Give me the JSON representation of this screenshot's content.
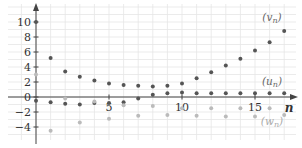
{
  "chart_data": {
    "type": "scatter",
    "title": "",
    "xlabel": "n",
    "ylabel": "",
    "xlim": [
      -0.5,
      19
    ],
    "ylim": [
      -6,
      12
    ],
    "grid": true,
    "legend": "inline-right",
    "x_ticks": [
      5,
      10,
      15
    ],
    "x_tick_labels": [
      "5",
      "10",
      "15"
    ],
    "y_ticks": [
      10,
      8,
      6,
      4,
      2,
      0,
      -2,
      -4
    ],
    "y_tick_labels": [
      "10",
      "8",
      "6",
      "4",
      "2",
      "0",
      "−2",
      "−4"
    ],
    "colors": {
      "dark": "#555555",
      "light": "#bbbbbb",
      "axis": "#444444",
      "grid": "#e6e6e6"
    },
    "series": [
      {
        "name": "(v_n)",
        "label_main": "(v",
        "label_sub": "n",
        "label_close": ")",
        "shade": "dark",
        "x": [
          0,
          1,
          2,
          3,
          4,
          5,
          6,
          7,
          8,
          9,
          10,
          11,
          12,
          13,
          14,
          15,
          16,
          17
        ],
        "values": [
          10,
          5.2,
          3.4,
          2.7,
          2.2,
          1.8,
          1.6,
          1.5,
          1.4,
          1.5,
          1.8,
          2.5,
          3.3,
          4.2,
          5.1,
          6.2,
          7.3,
          8.8
        ]
      },
      {
        "name": "(u_n)",
        "label_main": "(u",
        "label_sub": "n",
        "label_close": ")",
        "shade": "dark",
        "x": [
          0,
          1,
          2,
          3,
          4,
          5,
          6,
          7,
          8,
          9,
          10,
          11,
          12,
          13,
          14,
          15,
          16,
          17
        ],
        "values": [
          -0.5,
          -0.7,
          -0.9,
          -1,
          -0.8,
          -0.8,
          -0.7,
          -0.2,
          0.3,
          0.5,
          0.6,
          0.5,
          0.5,
          0.5,
          0.5,
          0.5,
          0.5,
          0.5
        ]
      },
      {
        "name": "(w_n)",
        "label_main": "(w",
        "label_sub": "n",
        "label_close": ")",
        "shade": "light",
        "x": [
          0,
          1,
          2,
          3,
          4,
          5,
          6,
          7,
          8,
          9,
          10,
          11,
          12,
          13,
          14,
          15,
          16,
          17
        ],
        "values": [
          3,
          -4.5,
          -0.2,
          -3.4,
          -0.6,
          -2.9,
          -1.1,
          -2.5,
          -1.2,
          -2.4,
          -1.5,
          -2.5,
          -1.5,
          -2.6,
          -1.5,
          -2.6,
          -1.5,
          -2.4
        ]
      }
    ]
  }
}
